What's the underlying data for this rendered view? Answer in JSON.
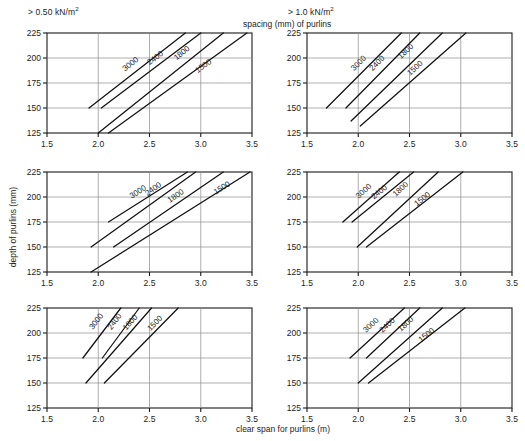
{
  "headers": {
    "left": "> 0.50 kN/m",
    "left_sup": "2",
    "right": "> 1.0 kN/m",
    "right_sup": "2"
  },
  "captions": {
    "spacing": "spacing (mm) of purlins",
    "xaxis": "clear span for purlins (m)",
    "yaxis": "depth of  purlins (mm)"
  },
  "chart_data": {
    "type": "line",
    "xlabel": "clear span for purlins (m)",
    "ylabel": "depth of  purlins (mm)",
    "xlim": [
      1.5,
      3.5
    ],
    "ylim": [
      125,
      225
    ],
    "xticks": [
      1.5,
      2.0,
      2.5,
      3.0,
      3.5
    ],
    "xtick_labels": [
      "1.5",
      "2.0",
      "2.5",
      "3.0",
      "3.5"
    ],
    "yticks": [
      125,
      150,
      175,
      200,
      225
    ],
    "ytick_labels": [
      "125",
      "150",
      "175",
      "200",
      "225"
    ],
    "grid": true,
    "legend": "inline-curve-labels",
    "series_names": [
      "3000",
      "2400",
      "1800",
      "1500"
    ],
    "column_conditions": [
      "> 0.50 kN/m2",
      "> 1.0 kN/m2"
    ],
    "panels": [
      {
        "id": "top-left",
        "row": 0,
        "column": 0,
        "condition": "> 0.50 kN/m2",
        "series": [
          {
            "name": "3000",
            "x": [
              1.91,
              2.85
            ],
            "y": [
              150,
              225
            ],
            "label_x": 2.33,
            "label_y": 192
          },
          {
            "name": "2400",
            "x": [
              2.03,
              3.0
            ],
            "y": [
              150,
              225
            ],
            "label_x": 2.57,
            "label_y": 198
          },
          {
            "name": "1800",
            "x": [
              2.0,
              3.22
            ],
            "y": [
              125,
              225
            ],
            "label_x": 2.83,
            "label_y": 203
          },
          {
            "name": "1500",
            "x": [
              2.1,
              3.45
            ],
            "y": [
              125,
              225
            ],
            "label_x": 3.04,
            "label_y": 190
          }
        ]
      },
      {
        "id": "top-right",
        "row": 0,
        "column": 1,
        "condition": "> 1.0 kN/m2",
        "series": [
          {
            "name": "3000",
            "x": [
              1.69,
              2.42
            ],
            "y": [
              150,
              225
            ],
            "label_x": 2.02,
            "label_y": 193
          },
          {
            "name": "2400",
            "x": [
              1.88,
              2.6
            ],
            "y": [
              150,
              225
            ],
            "label_x": 2.2,
            "label_y": 193
          },
          {
            "name": "1800",
            "x": [
              1.93,
              2.82
            ],
            "y": [
              137,
              225
            ],
            "label_x": 2.48,
            "label_y": 205
          },
          {
            "name": "1500",
            "x": [
              2.02,
              3.05
            ],
            "y": [
              132,
              225
            ],
            "label_x": 2.57,
            "label_y": 188
          }
        ]
      },
      {
        "id": "mid-left",
        "row": 1,
        "column": 0,
        "condition": "> 0.50 kN/m2",
        "series": [
          {
            "name": "3000",
            "x": [
              2.1,
              2.87
            ],
            "y": [
              175,
              225
            ],
            "label_x": 2.4,
            "label_y": 203
          },
          {
            "name": "2400",
            "x": [
              1.93,
              2.95
            ],
            "y": [
              150,
              225
            ],
            "label_x": 2.55,
            "label_y": 206
          },
          {
            "name": "1800",
            "x": [
              2.15,
              3.22
            ],
            "y": [
              150,
              225
            ],
            "label_x": 2.77,
            "label_y": 199
          },
          {
            "name": "1500",
            "x": [
              1.93,
              3.48
            ],
            "y": [
              125,
              225
            ],
            "label_x": 3.22,
            "label_y": 207
          }
        ]
      },
      {
        "id": "mid-right",
        "row": 1,
        "column": 1,
        "condition": "> 1.0 kN/m2",
        "series": [
          {
            "name": "3000",
            "x": [
              1.85,
              2.4
            ],
            "y": [
              175,
              225
            ],
            "label_x": 2.07,
            "label_y": 204
          },
          {
            "name": "2400",
            "x": [
              1.94,
              2.54
            ],
            "y": [
              175,
              225
            ],
            "label_x": 2.22,
            "label_y": 203
          },
          {
            "name": "1800",
            "x": [
              1.99,
              2.78
            ],
            "y": [
              150,
              225
            ],
            "label_x": 2.43,
            "label_y": 206
          },
          {
            "name": "1500",
            "x": [
              2.08,
              3.02
            ],
            "y": [
              150,
              225
            ],
            "label_x": 2.64,
            "label_y": 196
          }
        ]
      },
      {
        "id": "bottom-left",
        "row": 2,
        "column": 0,
        "condition": "> 0.50 kN/m2",
        "series": [
          {
            "name": "3000",
            "x": [
              1.85,
              2.22
            ],
            "y": [
              175,
              225
            ],
            "label_x": 2.0,
            "label_y": 210
          },
          {
            "name": "2400",
            "x": [
              2.04,
              2.4
            ],
            "y": [
              175,
              225
            ],
            "label_x": 2.18,
            "label_y": 210
          },
          {
            "name": "1800",
            "x": [
              1.88,
              2.52
            ],
            "y": [
              150,
              225
            ],
            "label_x": 2.33,
            "label_y": 209
          },
          {
            "name": "1500",
            "x": [
              2.06,
              2.78
            ],
            "y": [
              150,
              225
            ],
            "label_x": 2.57,
            "label_y": 208
          }
        ]
      },
      {
        "id": "bottom-right",
        "row": 2,
        "column": 1,
        "condition": "> 1.0 kN/m2",
        "series": [
          {
            "name": "3000",
            "x": [
              1.92,
              2.45
            ],
            "y": [
              175,
              225
            ],
            "label_x": 2.14,
            "label_y": 206
          },
          {
            "name": "2400",
            "x": [
              2.08,
              2.6
            ],
            "y": [
              175,
              225
            ],
            "label_x": 2.3,
            "label_y": 206
          },
          {
            "name": "1800",
            "x": [
              2.0,
              2.82
            ],
            "y": [
              150,
              225
            ],
            "label_x": 2.48,
            "label_y": 207
          },
          {
            "name": "1500",
            "x": [
              2.1,
              3.04
            ],
            "y": [
              150,
              225
            ],
            "label_x": 2.68,
            "label_y": 196
          }
        ]
      }
    ]
  }
}
